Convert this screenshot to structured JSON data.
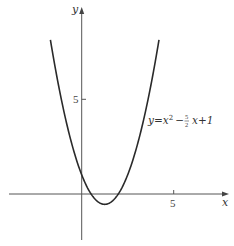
{
  "chart_data": {
    "type": "line",
    "title": "",
    "xlabel": "x",
    "ylabel": "y",
    "equation_label": "y = x² − (5/2) x + 1",
    "equation_parts": {
      "lhs": "y=x",
      "sup": "2",
      "minus": "−",
      "frac_num": "5",
      "frac_den": "2",
      "rest": "x+1"
    },
    "x_ticks": [
      5
    ],
    "x_tick_labels": [
      "5"
    ],
    "y_ticks": [
      5
    ],
    "y_tick_labels": [
      "5"
    ],
    "xlim": [
      -4.0,
      5.8
    ],
    "ylim": [
      -2.4,
      10.2
    ],
    "grid": false,
    "legend": "none",
    "series": [
      {
        "name": "y = x^2 - (5/2)x + 1",
        "x": [
          -1.7,
          -1.5,
          -1.0,
          -0.5,
          0,
          0.5,
          1.0,
          1.25,
          1.5,
          2.0,
          2.5,
          3.0,
          3.5,
          4.0,
          4.2
        ],
        "y": [
          8.14,
          7.0,
          4.5,
          2.5,
          1.0,
          0.0,
          -0.5,
          -0.5625,
          -0.5,
          0.0,
          1.0,
          2.5,
          4.5,
          7.0,
          8.14
        ]
      }
    ],
    "key_points": {
      "vertex": [
        1.25,
        -0.5625
      ],
      "y_intercept": [
        0,
        1
      ],
      "x_intercepts": [
        0.5,
        2
      ]
    },
    "colors": {
      "curve": "#2a2a2a",
      "axes": "#555555"
    }
  }
}
